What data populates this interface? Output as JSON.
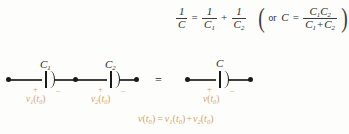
{
  "figure": {
    "colors": {
      "wire": "#3f3f3f",
      "node": "#1a1a1a",
      "math_text": "#2b2b2b",
      "voltage_label": "#d9a464",
      "polarity_mark": "#d7a05a",
      "background": "#fdfdfc"
    }
  },
  "top_formula": {
    "lhs_num": "1",
    "lhs_den": "C",
    "equals": "=",
    "term1_num": "1",
    "term1_den": "C",
    "term1_den_sub": "1",
    "plus": "+",
    "term2_num": "1",
    "term2_den": "C",
    "term2_den_sub": "2",
    "paren_open": "(",
    "or_word": "or",
    "alt_lhs": "C",
    "alt_equals": "=",
    "alt_num_a": "C",
    "alt_num_a_sub": "1",
    "alt_num_b": "C",
    "alt_num_b_sub": "2",
    "alt_den_a": "C",
    "alt_den_a_sub": "1",
    "alt_den_plus": "+",
    "alt_den_b": "C",
    "alt_den_b_sub": "2",
    "paren_close": ")"
  },
  "left_circuit": {
    "capacitor1": {
      "label": "C",
      "label_sub": "1",
      "plus": "+",
      "minus": "–",
      "voltage": "v",
      "voltage_sub": "1",
      "voltage_arg_open": "(",
      "voltage_arg": "t",
      "voltage_arg_sub": "0",
      "voltage_arg_close": ")"
    },
    "capacitor2": {
      "label": "C",
      "label_sub": "2",
      "plus": "+",
      "minus": "–",
      "voltage": "v",
      "voltage_sub": "2",
      "voltage_arg_open": "(",
      "voltage_arg": "t",
      "voltage_arg_sub": "0",
      "voltage_arg_close": ")"
    }
  },
  "equivalence": {
    "symbol": "="
  },
  "right_circuit": {
    "capacitor": {
      "label": "C",
      "plus": "+",
      "minus": "–",
      "voltage": "v",
      "voltage_arg_open": "(",
      "voltage_arg": "t",
      "voltage_arg_sub": "0",
      "voltage_arg_close": ")"
    }
  },
  "bottom_equation": {
    "lhs": "v",
    "lhs_arg_open": "(",
    "lhs_arg": "t",
    "lhs_arg_sub": "0",
    "lhs_arg_close": ")",
    "equals": "=",
    "rhs1": "v",
    "rhs1_sub": "1",
    "rhs1_arg_open": "(",
    "rhs1_arg": "t",
    "rhs1_arg_sub": "0",
    "rhs1_arg_close": ")",
    "plus": "+",
    "rhs2": "v",
    "rhs2_sub": "2",
    "rhs2_arg_open": "(",
    "rhs2_arg": "t",
    "rhs2_arg_sub": "0",
    "rhs2_arg_close": ")"
  }
}
